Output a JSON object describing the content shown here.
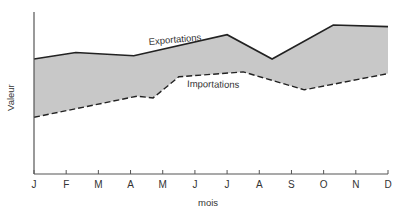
{
  "chart_data": {
    "type": "area",
    "title": "",
    "xlabel": "mois",
    "ylabel": "Valeur",
    "categories": [
      "J",
      "F",
      "M",
      "A",
      "M",
      "J",
      "J",
      "A",
      "S",
      "O",
      "N",
      "D"
    ],
    "x_ticks": [
      "J",
      "F",
      "M",
      "A",
      "M",
      "J",
      "J",
      "A",
      "S",
      "O",
      "N",
      "D"
    ],
    "y_ticks": [],
    "ylim": [
      0,
      100
    ],
    "grid": false,
    "legend": "inline labels",
    "fill_between_series": true,
    "fill_color": "#c8c8c8",
    "series": [
      {
        "name": "Exportations",
        "style": "solid",
        "color": "#222222",
        "points": [
          {
            "x": 0.0,
            "y": 71
          },
          {
            "x": 1.3,
            "y": 75
          },
          {
            "x": 3.1,
            "y": 73
          },
          {
            "x": 6.0,
            "y": 86
          },
          {
            "x": 7.4,
            "y": 71
          },
          {
            "x": 9.3,
            "y": 92
          },
          {
            "x": 11.0,
            "y": 91
          }
        ]
      },
      {
        "name": "Importations",
        "style": "dashed",
        "color": "#222222",
        "points": [
          {
            "x": 0.0,
            "y": 35
          },
          {
            "x": 3.2,
            "y": 48
          },
          {
            "x": 3.7,
            "y": 47
          },
          {
            "x": 4.5,
            "y": 60
          },
          {
            "x": 6.5,
            "y": 63
          },
          {
            "x": 8.4,
            "y": 52
          },
          {
            "x": 11.0,
            "y": 62
          }
        ]
      }
    ],
    "annotations": [
      {
        "text": "Exportations",
        "near_series": "Exportations"
      },
      {
        "text": "Importations",
        "near_series": "Importations"
      }
    ]
  },
  "labels": {
    "xlabel": "mois",
    "ylabel": "Valeur",
    "exports": "Exportations",
    "imports": "Importations"
  }
}
